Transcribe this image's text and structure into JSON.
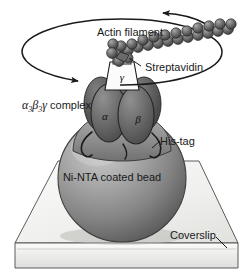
{
  "figure": {
    "background_color": "#ffffff"
  },
  "labels": {
    "actin_filament": "Actin filament",
    "streptavidin": "Streptavidin",
    "complex": "complex",
    "complex_alpha": "α",
    "complex_alpha_sub": "3",
    "complex_beta": "β",
    "complex_beta_sub": "3",
    "complex_gamma": "γ",
    "his_tag": "His-tag",
    "bead": "Ni-NTA coated bead",
    "coverslip": "Coverslip",
    "subunit_alpha": "α",
    "subunit_beta": "β",
    "subunit_gamma": "γ"
  },
  "colors": {
    "outline": "#1a1a1a",
    "bead_fill": "#8c8c8c",
    "bead_highlight": "#c9c9c9",
    "bead_shadow": "#5e5e5e",
    "subunit_fill": "#6e6e6e",
    "subunit_dark": "#545454",
    "base_ring": "#9a9a9a",
    "coverslip_top": "#f2f2f0",
    "coverslip_front": "#e4e4e2",
    "actin_bead": "#6a6a6a",
    "actin_bead_light": "#a5a5a5",
    "gamma_box": "#fbfbfb",
    "text": "#1a1a1a"
  },
  "icons": {
    "rotation_arrow_left": "arrowhead-icon",
    "rotation_arrow_right": "arrowhead-icon"
  },
  "rotation": {
    "ellipse_cx": 122,
    "ellipse_cy": 52,
    "ellipse_rx": 100,
    "ellipse_ry": 33
  }
}
